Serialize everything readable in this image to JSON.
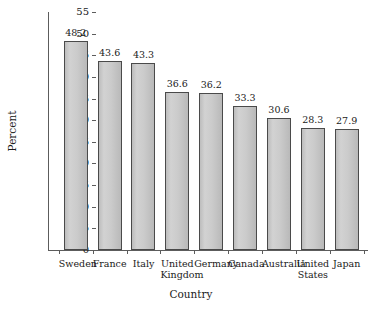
{
  "chart_data": {
    "type": "bar",
    "title": "",
    "xlabel": "Country",
    "ylabel": "Percent",
    "categories": [
      "Sweden",
      "France",
      "Italy",
      "United Kingdom",
      "Germany",
      "Canada",
      "Australia",
      "United States",
      "Japan"
    ],
    "values": [
      48.2,
      43.6,
      43.3,
      36.6,
      36.2,
      33.3,
      30.6,
      28.3,
      27.9
    ],
    "value_labels": [
      "48.2",
      "43.6",
      "43.3",
      "36.6",
      "36.2",
      "33.3",
      "30.6",
      "28.3",
      "27.9"
    ],
    "ylim": [
      0,
      55
    ],
    "ytick_values": [
      0,
      5,
      10,
      15,
      20,
      25,
      30,
      35,
      40,
      45,
      50,
      55
    ],
    "ytick_labels": [
      "0",
      "5",
      "10",
      "15",
      "20",
      "25",
      "30",
      "35",
      "40",
      "45",
      "50",
      "55"
    ],
    "grid": false,
    "legend": "none",
    "bar_fill": "#c9c9c9",
    "bar_edge": "#4a4a4a",
    "axis_color": "#5c5c5c",
    "background": "#ffffff"
  }
}
